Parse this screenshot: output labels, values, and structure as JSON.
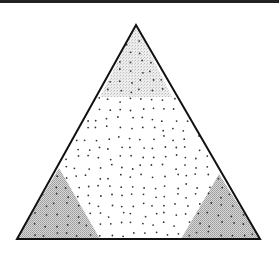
{
  "diagram": {
    "type": "ternary-triangle",
    "triangle": {
      "apex": [
        136,
        25
      ],
      "left_base": [
        17,
        239
      ],
      "right_base": [
        260,
        239
      ],
      "stroke_color": "#111111",
      "stroke_width": 2
    },
    "regions": [
      {
        "name": "top-corner-region",
        "shade": "light",
        "polygon": [
          [
            136,
            25
          ],
          [
            100,
            97
          ],
          [
            172,
            97
          ]
        ],
        "fill_color": "#e4e4e4"
      },
      {
        "name": "left-corner-region",
        "shade": "medium",
        "polygon": [
          [
            17,
            239
          ],
          [
            59,
            168
          ],
          [
            100,
            239
          ]
        ],
        "fill_color": "#c8c8c8"
      },
      {
        "name": "right-corner-region",
        "shade": "medium",
        "polygon": [
          [
            260,
            239
          ],
          [
            219,
            174
          ],
          [
            181,
            239
          ]
        ],
        "fill_color": "#c8c8c8"
      }
    ],
    "point_color": "#333333",
    "point_radius": 0.9,
    "top_border_color": "#222222"
  }
}
